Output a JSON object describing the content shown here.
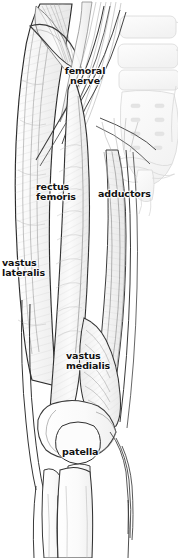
{
  "figure": {
    "kind": "anatomical-illustration",
    "width": 178,
    "height": 558,
    "background_color": "#ffffff",
    "line_color": "#1a1a1a",
    "muscle_fill": "#f2f2f2",
    "bone_fill": "#fafafa",
    "label_color": "#111111"
  },
  "labels": [
    {
      "id": "femoral-nerve",
      "text": "femoral\nnerve",
      "line1": "femoral",
      "line2": "nerve"
    },
    {
      "id": "rectus-femoris",
      "text": "rectus\nfemoris",
      "line1": "rectus",
      "line2": "femoris"
    },
    {
      "id": "adductors",
      "text": "adductors",
      "line1": "adductors",
      "line2": ""
    },
    {
      "id": "vastus-lateralis",
      "text": "vastus\nlateralis",
      "line1": "vastus",
      "line2": "lateralis"
    },
    {
      "id": "vastus-medialis",
      "text": "vastus\nmedialis",
      "line1": "vastus",
      "line2": "medialis"
    },
    {
      "id": "patella",
      "text": "patella",
      "line1": "patella",
      "line2": ""
    }
  ],
  "structures": [
    "iliac crest",
    "sacrum",
    "sacral foramina",
    "pubic symphysis",
    "femoral nerve",
    "rectus femoris",
    "adductor group",
    "vastus lateralis",
    "vastus medialis",
    "sartorius",
    "iliotibial tract",
    "patella",
    "patellar tendon",
    "tibia",
    "fibula"
  ]
}
